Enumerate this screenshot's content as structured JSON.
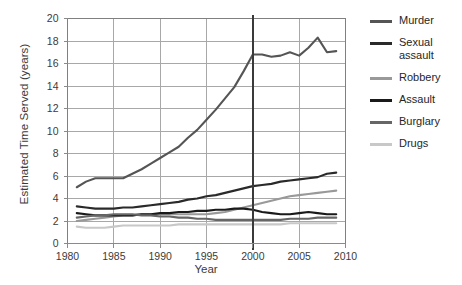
{
  "chart_data": {
    "type": "line",
    "title": "",
    "xlabel": "Year",
    "ylabel": "Estimated Time Served (years)",
    "xlim": [
      1980,
      2010
    ],
    "ylim": [
      0,
      20
    ],
    "xticks": [
      1980,
      1985,
      1990,
      1995,
      2000,
      2005,
      2010
    ],
    "yticks": [
      0,
      2,
      4,
      6,
      8,
      10,
      12,
      14,
      16,
      18,
      20
    ],
    "grid": true,
    "legend_position": "right",
    "annotations": [
      {
        "type": "vline",
        "x": 2000,
        "color": "#3a3a3a",
        "width": 2.5
      }
    ],
    "x": [
      1981,
      1982,
      1983,
      1984,
      1985,
      1986,
      1987,
      1988,
      1989,
      1990,
      1991,
      1992,
      1993,
      1994,
      1995,
      1996,
      1997,
      1998,
      1999,
      2000,
      2001,
      2002,
      2003,
      2004,
      2005,
      2006,
      2007,
      2008,
      2009
    ],
    "series": [
      {
        "name": "Murder",
        "color": "#555555",
        "values": [
          5.0,
          5.5,
          5.8,
          5.8,
          5.8,
          5.8,
          6.2,
          6.6,
          7.1,
          7.6,
          8.1,
          8.6,
          9.4,
          10.1,
          11.0,
          11.9,
          12.9,
          13.9,
          15.3,
          16.8,
          16.8,
          16.6,
          16.7,
          17.0,
          16.7,
          17.4,
          18.3,
          17.0,
          17.1
        ]
      },
      {
        "name": "Sexual\nassault",
        "color": "#2a2a2a",
        "values": [
          3.3,
          3.2,
          3.1,
          3.1,
          3.1,
          3.2,
          3.2,
          3.3,
          3.4,
          3.5,
          3.6,
          3.7,
          3.9,
          4.0,
          4.2,
          4.3,
          4.5,
          4.7,
          4.9,
          5.1,
          5.2,
          5.3,
          5.5,
          5.6,
          5.7,
          5.8,
          5.9,
          6.2,
          6.3
        ]
      },
      {
        "name": "Robbery",
        "color": "#999999",
        "values": [
          2.0,
          2.1,
          2.2,
          2.3,
          2.4,
          2.5,
          2.5,
          2.6,
          2.6,
          2.6,
          2.6,
          2.6,
          2.6,
          2.6,
          2.6,
          2.7,
          2.8,
          3.0,
          3.2,
          3.4,
          3.6,
          3.8,
          4.0,
          4.2,
          4.3,
          4.4,
          4.5,
          4.6,
          4.7
        ]
      },
      {
        "name": "Assault",
        "color": "#1a1a1a",
        "values": [
          2.7,
          2.6,
          2.5,
          2.5,
          2.5,
          2.5,
          2.5,
          2.6,
          2.6,
          2.7,
          2.7,
          2.8,
          2.8,
          2.9,
          2.9,
          3.0,
          3.0,
          3.1,
          3.1,
          3.0,
          2.8,
          2.7,
          2.6,
          2.6,
          2.7,
          2.8,
          2.7,
          2.6,
          2.6
        ]
      },
      {
        "name": "Burglary",
        "color": "#666666",
        "values": [
          2.3,
          2.4,
          2.5,
          2.5,
          2.6,
          2.6,
          2.6,
          2.5,
          2.5,
          2.4,
          2.4,
          2.3,
          2.3,
          2.2,
          2.2,
          2.1,
          2.1,
          2.1,
          2.1,
          2.1,
          2.1,
          2.1,
          2.1,
          2.2,
          2.2,
          2.2,
          2.3,
          2.3,
          2.3
        ]
      },
      {
        "name": "Drugs",
        "color": "#c8c8c8",
        "values": [
          1.5,
          1.4,
          1.4,
          1.4,
          1.5,
          1.6,
          1.6,
          1.6,
          1.6,
          1.6,
          1.6,
          1.7,
          1.7,
          1.7,
          1.7,
          1.7,
          1.7,
          1.7,
          1.7,
          1.7,
          1.7,
          1.7,
          1.7,
          1.8,
          1.8,
          1.8,
          1.8,
          1.8,
          1.8
        ]
      }
    ]
  },
  "legend": {
    "items": [
      {
        "label": "Murder",
        "color": "#555555"
      },
      {
        "label": "Sexual\nassault",
        "color": "#2a2a2a"
      },
      {
        "label": "Robbery",
        "color": "#999999"
      },
      {
        "label": "Assault",
        "color": "#1a1a1a"
      },
      {
        "label": "Burglary",
        "color": "#666666"
      },
      {
        "label": "Drugs",
        "color": "#c8c8c8"
      }
    ]
  },
  "axes": {
    "y_title": "Estimated Time Served (years)",
    "x_title": "Year",
    "y_tick_labels": [
      "0",
      "2",
      "4",
      "6",
      "8",
      "10",
      "12",
      "14",
      "16",
      "18",
      "20"
    ],
    "x_tick_labels": [
      "1980",
      "1985",
      "1990",
      "1995",
      "2000",
      "2005",
      "2010"
    ]
  },
  "colors": {
    "frame": "#808080",
    "gridline": "#a8a8a8",
    "vline": "#3a3a3a",
    "text": "#3b3b3b",
    "background": "#ffffff"
  }
}
